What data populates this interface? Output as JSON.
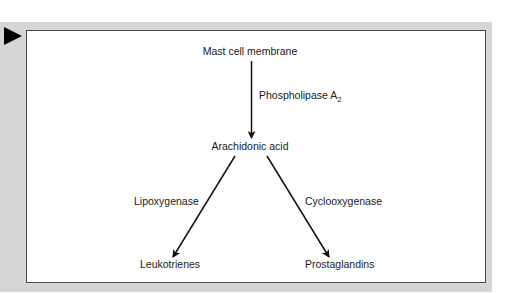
{
  "diagram": {
    "type": "flowchart",
    "colors": {
      "panel": "#d6d6d6",
      "box_border": "#4a4a4a",
      "arrow": "#111111",
      "marker": "#000000"
    },
    "nodes": {
      "source": "Mast cell membrane",
      "intermediate": "Arachidonic acid",
      "left_product": "Leukotrienes",
      "right_product": "Prostaglandins"
    },
    "edges": {
      "phospholipase": {
        "label": "Phospholipase A",
        "subscript": "2",
        "from": "Mast cell membrane",
        "to": "Arachidonic acid"
      },
      "lipoxygenase": {
        "label": "Lipoxygenase",
        "from": "Arachidonic acid",
        "to": "Leukotrienes"
      },
      "cyclooxygenase": {
        "label": "Cyclooxygenase",
        "from": "Arachidonic acid",
        "to": "Prostaglandins"
      }
    }
  }
}
